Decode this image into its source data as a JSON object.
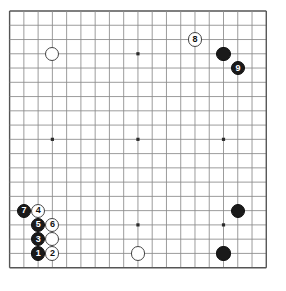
{
  "board": {
    "title": "Go game diagram",
    "size": 19,
    "origin_x": 9.6,
    "origin_y": 11.0,
    "spacing": 14.26,
    "stone_radius": 7.1,
    "line_color": "#8a8a8a",
    "border_color": "#555555",
    "background_color": "#ffffff",
    "black_color": "#1a1a1a",
    "white_color": "#ffffff",
    "star_points": [
      {
        "col": 3,
        "row": 3
      },
      {
        "col": 9,
        "row": 3
      },
      {
        "col": 15,
        "row": 3
      },
      {
        "col": 3,
        "row": 9
      },
      {
        "col": 9,
        "row": 9
      },
      {
        "col": 15,
        "row": 9
      },
      {
        "col": 3,
        "row": 15
      },
      {
        "col": 9,
        "row": 15
      },
      {
        "col": 15,
        "row": 15
      }
    ],
    "stones": [
      {
        "name": "stone-white-upper-left",
        "color": "white",
        "col": 3,
        "row": 3,
        "label": ""
      },
      {
        "name": "stone-white-move-8",
        "color": "white",
        "col": 13,
        "row": 2,
        "label": "8"
      },
      {
        "name": "stone-black-upper-right",
        "color": "black",
        "col": 15,
        "row": 3,
        "label": ""
      },
      {
        "name": "stone-black-move-9",
        "color": "black",
        "col": 16,
        "row": 4,
        "label": "9"
      },
      {
        "name": "stone-black-right-side",
        "color": "black",
        "col": 16,
        "row": 14,
        "label": ""
      },
      {
        "name": "stone-black-lower-right",
        "color": "black",
        "col": 15,
        "row": 17,
        "label": ""
      },
      {
        "name": "stone-white-lower-center",
        "color": "white",
        "col": 9,
        "row": 17,
        "label": ""
      },
      {
        "name": "stone-black-move-7",
        "color": "black",
        "col": 1,
        "row": 14,
        "label": "7"
      },
      {
        "name": "stone-white-move-4",
        "color": "white",
        "col": 2,
        "row": 14,
        "label": "4"
      },
      {
        "name": "stone-black-move-5",
        "color": "black",
        "col": 2,
        "row": 15,
        "label": "5"
      },
      {
        "name": "stone-white-move-6",
        "color": "white",
        "col": 3,
        "row": 15,
        "label": "6"
      },
      {
        "name": "stone-black-move-3",
        "color": "black",
        "col": 2,
        "row": 16,
        "label": "3"
      },
      {
        "name": "stone-white-plain-right",
        "color": "white",
        "col": 3,
        "row": 16,
        "label": ""
      },
      {
        "name": "stone-black-move-1",
        "color": "black",
        "col": 2,
        "row": 17,
        "label": "1"
      },
      {
        "name": "stone-white-move-2",
        "color": "white",
        "col": 3,
        "row": 17,
        "label": "2"
      }
    ]
  }
}
